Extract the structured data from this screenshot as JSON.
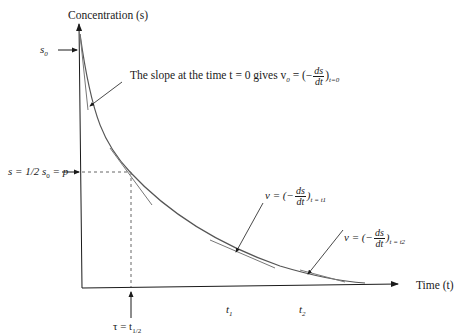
{
  "diagram": {
    "y_axis_label": "Concentration (s)",
    "x_axis_label": "Time (t)",
    "s0_label": "s",
    "s0_sub": "0",
    "half_label": {
      "prefix": "s = 1/2 s",
      "sub": "0",
      "suffix": " = p"
    },
    "tau_label": {
      "prefix": "τ = t",
      "sub": "1/2"
    },
    "t1_label": {
      "main": "t",
      "sub": "1"
    },
    "t2_label": {
      "main": "t",
      "sub": "2"
    },
    "annotations": [
      {
        "id": "v0",
        "text": "The slope at the time t = 0 gives v",
        "v_sub": "0",
        "eq": " = (−",
        "num": "ds",
        "den": "dt",
        "close": ")",
        "sub": "t=0"
      },
      {
        "id": "v1",
        "text": "v = (−",
        "num": "ds",
        "den": "dt",
        "close": ")",
        "sub": "t = t1"
      },
      {
        "id": "v2",
        "text": "v = (−",
        "num": "ds",
        "den": "dt",
        "close": ")",
        "sub": "t = t2"
      }
    ],
    "colors": {
      "axis": "#1a1a1a",
      "curve": "#555555",
      "tangent": "#777777",
      "dashed": "#666666"
    }
  }
}
